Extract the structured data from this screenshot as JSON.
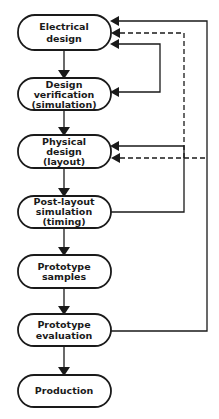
{
  "diagram": {
    "type": "flowchart",
    "colors": {
      "line": "#1a1a1a",
      "background": "#ffffff"
    },
    "nodes": [
      {
        "id": "electrical",
        "lines": [
          "Electrical",
          "design"
        ]
      },
      {
        "id": "verification",
        "lines": [
          "Design",
          "verification",
          "(simulation)"
        ]
      },
      {
        "id": "physical",
        "lines": [
          "Physical",
          "design",
          "(layout)"
        ]
      },
      {
        "id": "postlayout",
        "lines": [
          "Post-layout",
          "simulation",
          "(timing)"
        ]
      },
      {
        "id": "samples",
        "lines": [
          "Prototype",
          "samples"
        ]
      },
      {
        "id": "evaluation",
        "lines": [
          "Prototype",
          "evaluation"
        ]
      },
      {
        "id": "production",
        "lines": [
          "Production"
        ]
      }
    ],
    "edges": [
      {
        "from": "electrical",
        "to": "verification",
        "style": "solid"
      },
      {
        "from": "verification",
        "to": "physical",
        "style": "solid"
      },
      {
        "from": "physical",
        "to": "postlayout",
        "style": "solid"
      },
      {
        "from": "postlayout",
        "to": "samples",
        "style": "solid"
      },
      {
        "from": "samples",
        "to": "evaluation",
        "style": "solid"
      },
      {
        "from": "evaluation",
        "to": "production",
        "style": "solid"
      },
      {
        "from": "verification",
        "to": "electrical",
        "style": "solid",
        "kind": "feedback"
      },
      {
        "from": "postlayout",
        "to": "physical",
        "style": "solid",
        "kind": "feedback"
      },
      {
        "from": "physical",
        "to": "electrical",
        "style": "dashed",
        "kind": "feedback"
      },
      {
        "from": "evaluation",
        "to": "electrical",
        "style": "solid",
        "kind": "feedback"
      }
    ]
  }
}
